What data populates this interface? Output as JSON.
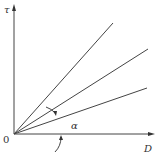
{
  "diagram": {
    "y_axis_label": "τ",
    "x_axis_label": "D",
    "origin_label": "0",
    "angle_label": "α",
    "lines": [
      {
        "name": "steep",
        "end": [
          113,
          23
        ]
      },
      {
        "name": "middle",
        "end": [
          148,
          49
        ]
      },
      {
        "name": "shallow",
        "end": [
          147,
          88
        ]
      }
    ]
  }
}
